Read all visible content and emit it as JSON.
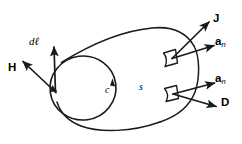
{
  "figure": {
    "background_color": "#ffffff",
    "stroke_color": "#1a1a1a",
    "width": 242,
    "height": 144
  },
  "labels": {
    "h_field": "H",
    "dl_element": "dℓ",
    "contour": "c",
    "surface": "s",
    "current_density": "J",
    "normal_upper": "a",
    "normal_upper_sub": "n",
    "normal_lower": "a",
    "normal_lower_sub": "n",
    "flux_density": "D"
  },
  "elements": {
    "surface_name": "open-surface-s",
    "contour_name": "boundary-contour-c",
    "patch_upper_name": "surface-patch-upper",
    "patch_lower_name": "surface-patch-lower"
  }
}
